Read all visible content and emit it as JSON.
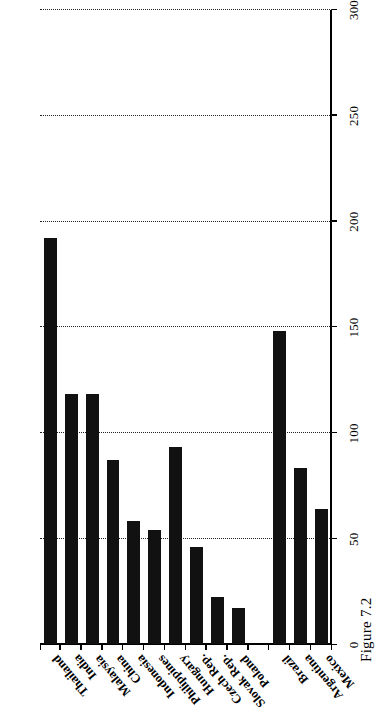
{
  "figure": {
    "caption": "Figure 7.2"
  },
  "chart_data": {
    "type": "bar",
    "orientation": "vertical",
    "title": "",
    "xlabel": "",
    "ylabel": "",
    "ylim": [
      0,
      300
    ],
    "yticks": [
      0,
      50,
      100,
      150,
      200,
      250,
      300
    ],
    "ytick_labels": [
      "0",
      "50",
      "100",
      "150",
      "200",
      "250",
      "300"
    ],
    "grid": "dotted-vertical-at-yticks",
    "legend": "none",
    "bar_color": "#111111",
    "categories": [
      "Thailand",
      "India",
      "Malaysia",
      "China",
      "Indonesia",
      "Philippines",
      "Hungary",
      "Czech Rep.",
      "Slovak Rep.",
      "Poland",
      "",
      "Brazil",
      "Argentina",
      "Mexico"
    ],
    "values": [
      192,
      118,
      118,
      87,
      58,
      54,
      93,
      46,
      22,
      17,
      0,
      148,
      83,
      64
    ]
  }
}
